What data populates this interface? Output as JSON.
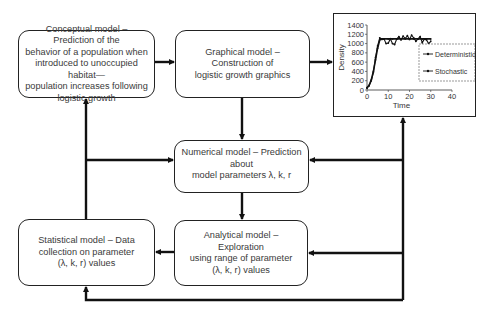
{
  "nodes": {
    "conceptual": {
      "label": "Conceptual model – Prediction of the behavior of a population when introduced to unoccupied habitat—population increases following logistic growth",
      "lines": [
        "Conceptual model – Prediction of the",
        "behavior of a population when",
        "introduced to unoccupied habitat—",
        "population increases following",
        "logistic growth"
      ]
    },
    "graphical": {
      "lines": [
        "Graphical model – Construction of",
        "logistic growth graphics"
      ]
    },
    "numerical": {
      "lines": [
        "Numerical model – Prediction about",
        "model parameters λ, k, r"
      ]
    },
    "statistical": {
      "lines": [
        "Statistical model – Data",
        "collection on parameter",
        "(λ, k, r) values"
      ]
    },
    "analytical": {
      "lines": [
        "Analytical model – Exploration",
        "using range of parameter",
        "(λ, k, r) values"
      ]
    }
  },
  "chart_data": {
    "type": "line",
    "title": "",
    "xlabel": "Time",
    "ylabel": "Density",
    "xlim": [
      0,
      40
    ],
    "ylim": [
      0,
      1400
    ],
    "xticks": [
      "0",
      "10",
      "20",
      "30",
      "40"
    ],
    "yticks": [
      "0",
      "200",
      "400",
      "600",
      "800",
      "1000",
      "1200",
      "1400"
    ],
    "legend": [
      "Deterministic",
      "Stochastic"
    ],
    "legend_position": "right",
    "series": [
      {
        "name": "Deterministic",
        "x": [
          0,
          1,
          2,
          3,
          4,
          5,
          6,
          7,
          8,
          10,
          12,
          14,
          16,
          18,
          20,
          22,
          24,
          26,
          28,
          30
        ],
        "values": [
          50,
          100,
          220,
          400,
          650,
          900,
          1080,
          1100,
          1100,
          1100,
          1100,
          1100,
          1100,
          1100,
          1100,
          1100,
          1100,
          1100,
          1100,
          1100
        ]
      },
      {
        "name": "Stochastic",
        "x": [
          0,
          1,
          2,
          3,
          4,
          5,
          6,
          7,
          8,
          9,
          10,
          11,
          12,
          13,
          14,
          15,
          16,
          17,
          18,
          19,
          20,
          21,
          22,
          23,
          24,
          25,
          26,
          27,
          28,
          29,
          30
        ],
        "values": [
          40,
          90,
          200,
          380,
          700,
          950,
          1120,
          1090,
          1100,
          1000,
          1010,
          1100,
          1000,
          980,
          1100,
          1150,
          1080,
          1160,
          1110,
          1170,
          1090,
          1180,
          1120,
          1050,
          1100,
          1150,
          1020,
          1100,
          1080,
          1000,
          1050
        ]
      }
    ]
  }
}
